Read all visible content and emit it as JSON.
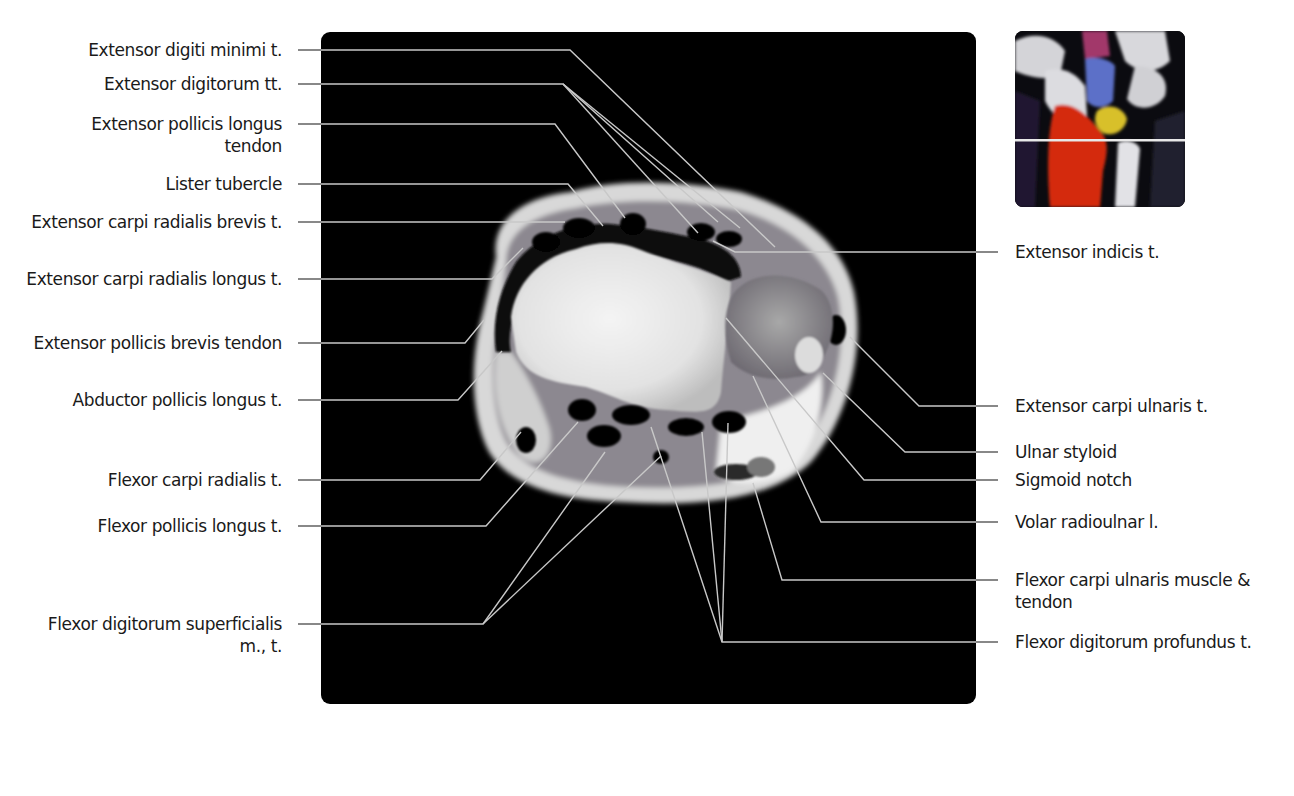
{
  "figure": {
    "type": "axial MRI of the wrist with labeled anatomy",
    "locator_inset": {
      "description": "coronal wrist radiograph with colored carpal bones and a horizontal slice-level line through the distal radius",
      "colors": {
        "radius": "#d42a10",
        "lunate": "#5b6fc8",
        "triquetrum": "#d8c02a",
        "capitate_top": "#a2396a",
        "slice_line": "#e8e8e8"
      }
    },
    "colors": {
      "panel_bg": "#000000",
      "leader_line": "#c8c8c8",
      "left_leader": "#6a6a6a",
      "text": "#1a1a1a"
    }
  },
  "labels_left": [
    {
      "id": "extensor-digiti-minimi",
      "lines": [
        "Extensor digiti minimi t."
      ],
      "y": 50
    },
    {
      "id": "extensor-digitorum",
      "lines": [
        "Extensor digitorum tt."
      ],
      "y": 84
    },
    {
      "id": "extensor-pollicis-longus",
      "lines": [
        "Extensor pollicis longus",
        "tendon"
      ],
      "y": 124
    },
    {
      "id": "lister-tubercle",
      "lines": [
        "Lister tubercle"
      ],
      "y": 184
    },
    {
      "id": "extensor-carpi-radialis-brevis",
      "lines": [
        "Extensor carpi radialis brevis t."
      ],
      "y": 222
    },
    {
      "id": "extensor-carpi-radialis-longus",
      "lines": [
        "Extensor carpi radialis longus t."
      ],
      "y": 279
    },
    {
      "id": "extensor-pollicis-brevis",
      "lines": [
        "Extensor pollicis brevis tendon"
      ],
      "y": 343
    },
    {
      "id": "abductor-pollicis-longus",
      "lines": [
        "Abductor pollicis longus t."
      ],
      "y": 400
    },
    {
      "id": "flexor-carpi-radialis",
      "lines": [
        "Flexor carpi radialis t."
      ],
      "y": 480
    },
    {
      "id": "flexor-pollicis-longus",
      "lines": [
        "Flexor pollicis longus t."
      ],
      "y": 526
    },
    {
      "id": "flexor-digitorum-superficialis",
      "lines": [
        "Flexor digitorum superficialis",
        "m., t."
      ],
      "y": 624
    }
  ],
  "labels_right": [
    {
      "id": "extensor-indicis",
      "lines": [
        "Extensor indicis t."
      ],
      "y": 252
    },
    {
      "id": "extensor-carpi-ulnaris",
      "lines": [
        "Extensor carpi ulnaris t."
      ],
      "y": 406
    },
    {
      "id": "ulnar-styloid",
      "lines": [
        "Ulnar styloid"
      ],
      "y": 452
    },
    {
      "id": "sigmoid-notch",
      "lines": [
        "Sigmoid notch"
      ],
      "y": 480
    },
    {
      "id": "volar-radioulnar-ligament",
      "lines": [
        "Volar radioulnar l."
      ],
      "y": 522
    },
    {
      "id": "flexor-carpi-ulnaris",
      "lines": [
        "Flexor carpi ulnaris muscle &",
        "tendon"
      ],
      "y": 580
    },
    {
      "id": "flexor-digitorum-profundus",
      "lines": [
        "Flexor digitorum profundus t."
      ],
      "y": 642
    }
  ],
  "text": {
    "l0": "Extensor digiti minimi t.",
    "l1": "Extensor digitorum tt.",
    "l2a": "Extensor pollicis longus",
    "l2b": "tendon",
    "l3": "Lister tubercle",
    "l4": "Extensor carpi radialis brevis t.",
    "l5": "Extensor carpi radialis longus t.",
    "l6": "Extensor pollicis brevis tendon",
    "l7": "Abductor pollicis longus t.",
    "l8": "Flexor carpi radialis t.",
    "l9": "Flexor pollicis longus t.",
    "l10a": "Flexor digitorum superficialis",
    "l10b": "m., t.",
    "r0": "Extensor indicis t.",
    "r1": "Extensor carpi ulnaris t.",
    "r2": "Ulnar styloid",
    "r3": "Sigmoid notch",
    "r4": "Volar radioulnar l.",
    "r5a": "Flexor carpi ulnaris muscle &",
    "r5b": "tendon",
    "r6": "Flexor digitorum profundus t."
  }
}
